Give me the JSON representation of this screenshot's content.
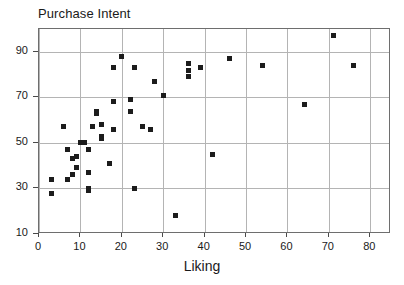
{
  "chart_data": {
    "type": "scatter",
    "title": "Purchase Intent",
    "xlabel": "Liking",
    "ylabel": "Purchase Intent",
    "xlim": [
      0,
      85
    ],
    "ylim": [
      10,
      100
    ],
    "grid": true,
    "legend": null,
    "x_ticks": [
      0,
      10,
      20,
      30,
      40,
      50,
      60,
      70,
      80
    ],
    "y_ticks": [
      10,
      30,
      50,
      70,
      90
    ],
    "marker": "square",
    "marker_color": "#1c1c1c",
    "points": [
      {
        "x": 3,
        "y": 28
      },
      {
        "x": 3,
        "y": 34
      },
      {
        "x": 6,
        "y": 57
      },
      {
        "x": 7,
        "y": 34
      },
      {
        "x": 7,
        "y": 47
      },
      {
        "x": 8,
        "y": 43
      },
      {
        "x": 8,
        "y": 36
      },
      {
        "x": 9,
        "y": 39
      },
      {
        "x": 9,
        "y": 44
      },
      {
        "x": 10,
        "y": 50
      },
      {
        "x": 11,
        "y": 50
      },
      {
        "x": 11,
        "y": 50
      },
      {
        "x": 12,
        "y": 29
      },
      {
        "x": 12,
        "y": 30
      },
      {
        "x": 12,
        "y": 37
      },
      {
        "x": 12,
        "y": 47
      },
      {
        "x": 13,
        "y": 57
      },
      {
        "x": 14,
        "y": 63
      },
      {
        "x": 14,
        "y": 64
      },
      {
        "x": 15,
        "y": 52
      },
      {
        "x": 15,
        "y": 53
      },
      {
        "x": 15,
        "y": 58
      },
      {
        "x": 17,
        "y": 41
      },
      {
        "x": 18,
        "y": 56
      },
      {
        "x": 18,
        "y": 68
      },
      {
        "x": 18,
        "y": 83
      },
      {
        "x": 20,
        "y": 88
      },
      {
        "x": 22,
        "y": 64
      },
      {
        "x": 22,
        "y": 69
      },
      {
        "x": 23,
        "y": 30
      },
      {
        "x": 23,
        "y": 83
      },
      {
        "x": 25,
        "y": 57
      },
      {
        "x": 27,
        "y": 56
      },
      {
        "x": 28,
        "y": 77
      },
      {
        "x": 30,
        "y": 71
      },
      {
        "x": 33,
        "y": 18
      },
      {
        "x": 36,
        "y": 79
      },
      {
        "x": 36,
        "y": 82
      },
      {
        "x": 36,
        "y": 85
      },
      {
        "x": 39,
        "y": 83
      },
      {
        "x": 42,
        "y": 45
      },
      {
        "x": 46,
        "y": 87
      },
      {
        "x": 54,
        "y": 84
      },
      {
        "x": 64,
        "y": 67
      },
      {
        "x": 71,
        "y": 97
      },
      {
        "x": 76,
        "y": 84
      }
    ]
  }
}
